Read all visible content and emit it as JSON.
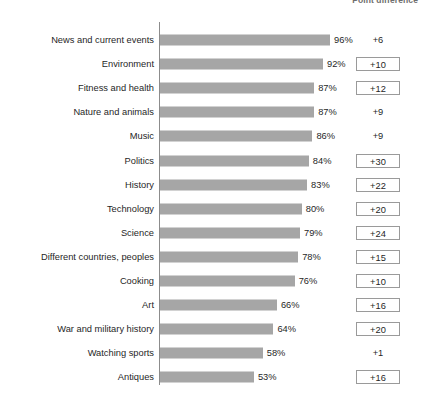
{
  "header": {
    "right_label": "Point difference"
  },
  "chart_data": {
    "type": "bar",
    "title": "",
    "subtitle": "",
    "xlabel": "",
    "ylabel": "",
    "orientation": "horizontal",
    "grid": false,
    "legend": "none",
    "xlim": [
      0,
      100
    ],
    "value_suffix": "%",
    "columns": [
      "Category",
      "Percent",
      "Point difference"
    ],
    "categories": [
      "News and current events",
      "Environment",
      "Fitness and health",
      "Nature and animals",
      "Music",
      "Politics",
      "History",
      "Technology",
      "Science",
      "Different countries, peoples",
      "Cooking",
      "Art",
      "War and military history",
      "Watching sports",
      "Antiques"
    ],
    "values": [
      96,
      92,
      87,
      87,
      86,
      84,
      83,
      80,
      79,
      78,
      76,
      66,
      64,
      58,
      53
    ],
    "value_labels": [
      "96%",
      "92%",
      "87%",
      "87%",
      "86%",
      "84%",
      "83%",
      "80%",
      "79%",
      "78%",
      "76%",
      "66%",
      "64%",
      "58%",
      "53%"
    ],
    "point_differences": [
      "+6",
      "+10",
      "+12",
      "+9",
      "+9",
      "+30",
      "+22",
      "+20",
      "+24",
      "+15",
      "+10",
      "+16",
      "+20",
      "+1",
      "+16"
    ],
    "point_difference_boxed": [
      false,
      true,
      true,
      false,
      false,
      true,
      true,
      true,
      true,
      true,
      true,
      true,
      true,
      false,
      true
    ],
    "bar_color": "#a6a6a6",
    "axis_color": "#8c8c8c",
    "text_color": "#1f1f1f"
  }
}
